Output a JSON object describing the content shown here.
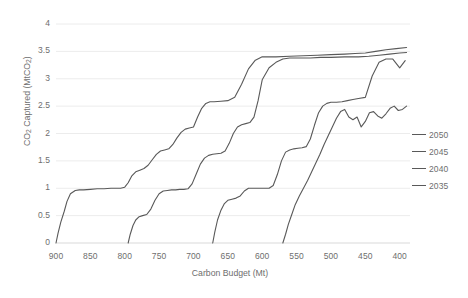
{
  "chart_data": {
    "type": "line",
    "title": "",
    "xlabel": "Carbon Budget (Mt)",
    "ylabel": "CO2 Captured (MtCO2)",
    "xlim": [
      900,
      385
    ],
    "ylim": [
      0,
      4
    ],
    "x_reversed": true,
    "grid": "horizontal",
    "legend_position": "right",
    "xticks": [
      900,
      850,
      800,
      750,
      700,
      650,
      600,
      550,
      500,
      450,
      400
    ],
    "yticks": [
      0,
      0.5,
      1,
      1.5,
      2,
      2.5,
      3,
      3.5,
      4
    ],
    "line_color": "#595959",
    "series": [
      {
        "name": "2050",
        "x": [
          900,
          897,
          893,
          888,
          884,
          879,
          872,
          866,
          860,
          850,
          840,
          830,
          820,
          812,
          806,
          800,
          795,
          790,
          784,
          778,
          772,
          766,
          760,
          754,
          748,
          742,
          736,
          730,
          724,
          718,
          712,
          706,
          700,
          694,
          688,
          682,
          676,
          670,
          660,
          650,
          640,
          630,
          620,
          610,
          600,
          580,
          560,
          540,
          520,
          500,
          480,
          465,
          450,
          435,
          420,
          405,
          390
        ],
        "y": [
          0.0,
          0.18,
          0.38,
          0.58,
          0.76,
          0.9,
          0.96,
          0.97,
          0.97,
          0.98,
          0.99,
          0.99,
          1.0,
          1.0,
          1.0,
          1.02,
          1.1,
          1.22,
          1.3,
          1.33,
          1.36,
          1.42,
          1.52,
          1.62,
          1.68,
          1.7,
          1.72,
          1.8,
          1.92,
          2.02,
          2.08,
          2.1,
          2.12,
          2.3,
          2.46,
          2.55,
          2.58,
          2.58,
          2.59,
          2.6,
          2.66,
          2.9,
          3.18,
          3.34,
          3.4,
          3.4,
          3.41,
          3.42,
          3.43,
          3.44,
          3.45,
          3.46,
          3.47,
          3.5,
          3.53,
          3.55,
          3.57
        ],
        "note": "leftmost staircase, reaches plateau near 3.4 by 600 Mt, ends ~3.57"
      },
      {
        "name": "2045",
        "x": [
          795,
          792,
          788,
          784,
          779,
          774,
          768,
          762,
          756,
          750,
          744,
          738,
          732,
          726,
          720,
          714,
          708,
          702,
          696,
          690,
          684,
          678,
          672,
          666,
          660,
          654,
          648,
          642,
          636,
          630,
          624,
          618,
          612,
          606,
          600,
          590,
          580,
          570,
          560,
          545,
          530,
          515,
          500,
          480,
          460,
          445,
          430,
          415,
          400,
          390
        ],
        "y": [
          0.0,
          0.16,
          0.32,
          0.42,
          0.48,
          0.5,
          0.52,
          0.62,
          0.78,
          0.9,
          0.95,
          0.96,
          0.97,
          0.97,
          0.98,
          0.98,
          0.99,
          1.08,
          1.26,
          1.44,
          1.55,
          1.6,
          1.62,
          1.63,
          1.64,
          1.68,
          1.82,
          2.0,
          2.12,
          2.16,
          2.18,
          2.2,
          2.3,
          2.6,
          2.98,
          3.2,
          3.3,
          3.36,
          3.38,
          3.38,
          3.38,
          3.39,
          3.39,
          3.4,
          3.4,
          3.41,
          3.43,
          3.45,
          3.47,
          3.48
        ],
        "note": "second staircase starting ~795 Mt"
      },
      {
        "name": "2040",
        "x": [
          672,
          669,
          665,
          660,
          655,
          650,
          644,
          638,
          632,
          626,
          620,
          614,
          608,
          602,
          596,
          590,
          584,
          578,
          572,
          566,
          560,
          554,
          548,
          542,
          536,
          530,
          524,
          518,
          512,
          506,
          500,
          492,
          484,
          476,
          468,
          460,
          450,
          440,
          430,
          420,
          410,
          400,
          392
        ],
        "y": [
          0.0,
          0.2,
          0.42,
          0.6,
          0.72,
          0.78,
          0.8,
          0.82,
          0.86,
          0.95,
          1.0,
          1.0,
          1.0,
          1.0,
          1.0,
          1.0,
          1.05,
          1.25,
          1.5,
          1.66,
          1.7,
          1.72,
          1.73,
          1.74,
          1.76,
          1.9,
          2.15,
          2.38,
          2.5,
          2.55,
          2.57,
          2.57,
          2.58,
          2.6,
          2.62,
          2.64,
          2.66,
          3.05,
          3.3,
          3.36,
          3.36,
          3.2,
          3.33
        ],
        "note": "third staircase, dips slightly near 405 Mt then recovers to ~3.33"
      },
      {
        "name": "2035",
        "x": [
          570,
          566,
          562,
          557,
          552,
          546,
          540,
          534,
          528,
          522,
          516,
          510,
          504,
          498,
          492,
          486,
          480,
          474,
          468,
          462,
          456,
          450,
          444,
          438,
          432,
          426,
          420,
          414,
          408,
          402,
          396,
          390
        ],
        "y": [
          0.0,
          0.16,
          0.34,
          0.52,
          0.7,
          0.86,
          1.0,
          1.14,
          1.3,
          1.46,
          1.62,
          1.8,
          1.96,
          2.12,
          2.28,
          2.4,
          2.44,
          2.3,
          2.25,
          2.3,
          2.12,
          2.22,
          2.38,
          2.4,
          2.32,
          2.28,
          2.36,
          2.46,
          2.5,
          2.42,
          2.44,
          2.5
        ],
        "note": "rightmost line, steep rise from 570 Mt, oscillates 2.1-2.5, ends ~2.5"
      }
    ]
  },
  "legend": {
    "entries": [
      {
        "label": "2050"
      },
      {
        "label": "2045"
      },
      {
        "label": "2040"
      },
      {
        "label": "2035"
      }
    ]
  },
  "axes": {
    "x_title": "Carbon Budget (Mt)",
    "y_title_prefix": "CO",
    "y_title_sub1": "2",
    "y_title_mid": " Captured (MtCO",
    "y_title_sub2": "2",
    "y_title_suffix": ")",
    "xtick_labels": [
      "900",
      "850",
      "800",
      "750",
      "700",
      "650",
      "600",
      "550",
      "500",
      "450",
      "400"
    ],
    "ytick_labels": [
      "0",
      "0.5",
      "1",
      "1.5",
      "2",
      "2.5",
      "3",
      "3.5",
      "4"
    ]
  }
}
